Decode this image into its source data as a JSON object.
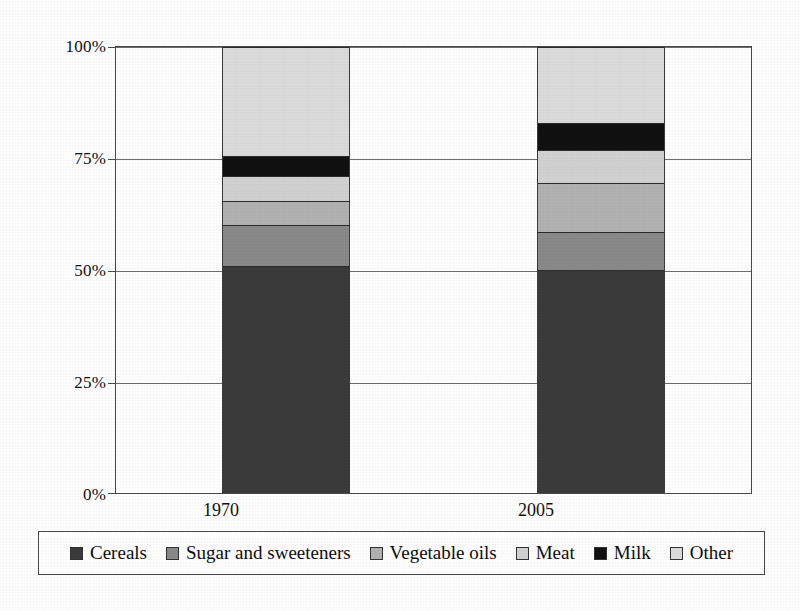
{
  "chart_data": {
    "type": "bar",
    "subtype": "stacked-percentage",
    "title": "",
    "xlabel": "",
    "ylabel": "",
    "categories": [
      "1970",
      "2005"
    ],
    "ylim": [
      0,
      100
    ],
    "y_ticks": [
      "0%",
      "25%",
      "50%",
      "75%",
      "100%"
    ],
    "y_tick_values": [
      0,
      25,
      50,
      75,
      100
    ],
    "grid": true,
    "legend_position": "bottom",
    "series": [
      {
        "name": "Cereals",
        "color": "#3b3b3b",
        "values": [
          51.0,
          50.0
        ]
      },
      {
        "name": "Sugar and sweeteners",
        "color": "#8a8a8a",
        "values": [
          9.0,
          8.5
        ]
      },
      {
        "name": "Vegetable oils",
        "color": "#b2b2b2",
        "values": [
          5.5,
          11.0
        ]
      },
      {
        "name": "Meat",
        "color": "#d2d2d2",
        "values": [
          5.5,
          7.5
        ]
      },
      {
        "name": "Milk",
        "color": "#111111",
        "values": [
          4.5,
          6.0
        ]
      },
      {
        "name": "Other",
        "color": "#dcdcdc",
        "values": [
          24.5,
          17.0
        ]
      }
    ]
  },
  "axis": {
    "y_ticks": [
      {
        "label": "100%",
        "value": 100
      },
      {
        "label": "75%",
        "value": 75
      },
      {
        "label": "50%",
        "value": 50
      },
      {
        "label": "25%",
        "value": 25
      },
      {
        "label": "0%",
        "value": 0
      }
    ],
    "x_ticks": [
      {
        "label": "1970"
      },
      {
        "label": "2005"
      }
    ]
  },
  "legend": {
    "items": [
      {
        "label": "Cereals",
        "color": "#3b3b3b"
      },
      {
        "label": "Sugar and sweeteners",
        "color": "#8a8a8a"
      },
      {
        "label": "Vegetable oils",
        "color": "#b2b2b2"
      },
      {
        "label": "Meat",
        "color": "#d2d2d2"
      },
      {
        "label": "Milk",
        "color": "#111111"
      },
      {
        "label": "Other",
        "color": "#dcdcdc"
      }
    ]
  },
  "colors": {
    "axis": "#4a4a4a",
    "grid": "#6e6e6e",
    "background": "#ffffff",
    "text": "#111111"
  }
}
